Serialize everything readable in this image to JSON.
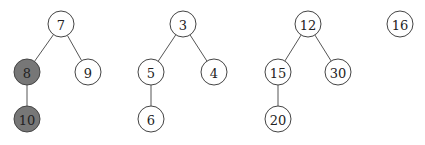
{
  "diagram": {
    "type": "forest",
    "colors": {
      "default_fill": "#ffffff",
      "highlight_fill": "#777777",
      "stroke": "#444444"
    },
    "trees": [
      {
        "root": "7",
        "nodes": [
          {
            "id": "n7",
            "label": "7",
            "x": 61,
            "y": 24,
            "highlighted": false
          },
          {
            "id": "n8",
            "label": "8",
            "x": 27,
            "y": 72,
            "highlighted": true
          },
          {
            "id": "n9",
            "label": "9",
            "x": 88,
            "y": 72,
            "highlighted": false
          },
          {
            "id": "n10",
            "label": "10",
            "x": 27,
            "y": 119,
            "highlighted": true
          }
        ],
        "edges": [
          [
            "n7",
            "n8"
          ],
          [
            "n7",
            "n9"
          ],
          [
            "n8",
            "n10"
          ]
        ]
      },
      {
        "root": "3",
        "nodes": [
          {
            "id": "n3",
            "label": "3",
            "x": 183,
            "y": 24,
            "highlighted": false
          },
          {
            "id": "n5",
            "label": "5",
            "x": 151,
            "y": 72,
            "highlighted": false
          },
          {
            "id": "n4",
            "label": "4",
            "x": 214,
            "y": 72,
            "highlighted": false
          },
          {
            "id": "n6",
            "label": "6",
            "x": 151,
            "y": 119,
            "highlighted": false
          }
        ],
        "edges": [
          [
            "n3",
            "n5"
          ],
          [
            "n3",
            "n4"
          ],
          [
            "n5",
            "n6"
          ]
        ]
      },
      {
        "root": "12",
        "nodes": [
          {
            "id": "n12",
            "label": "12",
            "x": 308,
            "y": 24,
            "highlighted": false
          },
          {
            "id": "n15",
            "label": "15",
            "x": 278,
            "y": 72,
            "highlighted": false
          },
          {
            "id": "n30",
            "label": "30",
            "x": 338,
            "y": 72,
            "highlighted": false
          },
          {
            "id": "n20",
            "label": "20",
            "x": 278,
            "y": 119,
            "highlighted": false
          }
        ],
        "edges": [
          [
            "n12",
            "n15"
          ],
          [
            "n12",
            "n30"
          ],
          [
            "n15",
            "n20"
          ]
        ]
      },
      {
        "root": "16",
        "nodes": [
          {
            "id": "n16",
            "label": "16",
            "x": 400,
            "y": 24,
            "highlighted": false
          }
        ],
        "edges": []
      }
    ]
  }
}
